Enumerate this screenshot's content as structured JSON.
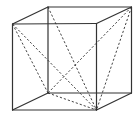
{
  "diagram": {
    "type": "wireframe-cube",
    "stroke_color": "#333333",
    "background": "#ffffff",
    "vertices": {
      "front_top_left": [
        12.5,
        24
      ],
      "front_top_right": [
        96.5,
        23.5
      ],
      "front_bottom_left": [
        12.5,
        110
      ],
      "front_bottom_right": [
        96.5,
        110
      ],
      "back_top_left": [
        48,
        7
      ],
      "back_top_right": [
        131.5,
        7
      ],
      "back_bottom_left": [
        48,
        93
      ],
      "back_bottom_right": [
        131.5,
        93
      ]
    },
    "solid_edges": [
      [
        "front_top_left",
        "front_top_right"
      ],
      [
        "front_top_right",
        "front_bottom_right"
      ],
      [
        "front_bottom_right",
        "front_bottom_left"
      ],
      [
        "front_bottom_left",
        "front_top_left"
      ],
      [
        "back_top_left",
        "back_top_right"
      ],
      [
        "back_top_right",
        "back_bottom_right"
      ],
      [
        "back_bottom_right",
        "back_bottom_left"
      ],
      [
        "back_bottom_left",
        "back_top_left"
      ],
      [
        "front_top_left",
        "back_top_left"
      ],
      [
        "front_top_right",
        "back_top_right"
      ],
      [
        "front_bottom_left",
        "back_bottom_left"
      ],
      [
        "front_bottom_right",
        "back_bottom_right"
      ]
    ],
    "dashed_edges": [
      [
        "front_top_left",
        "front_bottom_right"
      ],
      [
        "front_top_left",
        "back_bottom_left"
      ],
      [
        "back_top_left",
        "front_bottom_right"
      ],
      [
        "back_top_right",
        "front_bottom_right"
      ],
      [
        "back_top_right",
        "back_bottom_left"
      ],
      [
        "back_bottom_left",
        "front_bottom_right"
      ]
    ]
  }
}
